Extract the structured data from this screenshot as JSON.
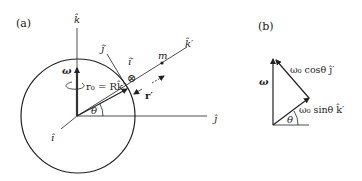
{
  "panel_a": {
    "label": "(a)",
    "axes": {
      "k_hat": "k̂",
      "j_hat": "ĵ",
      "i_hat": "î",
      "k_prime": "k̂′",
      "j_prime": "ĵ′",
      "i_prime": "î′"
    },
    "omega": "ω",
    "r0": "r₀ = Rk̂′",
    "r_prime": "r′",
    "mass": "m",
    "theta": "θ",
    "into_page_symbol": "⊗"
  },
  "panel_b": {
    "label": "(b)",
    "omega": "ω",
    "cos_component": "ω₀ cosθ ĵ′",
    "sin_component": "ω₀ sinθ k̂′",
    "theta": "θ"
  },
  "colors": {
    "line": "#222222",
    "omega_vector": "#333333"
  }
}
